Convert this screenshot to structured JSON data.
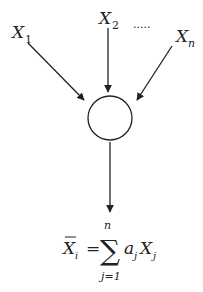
{
  "diagram": {
    "inputs": [
      {
        "symbol": "X",
        "subscript": "1"
      },
      {
        "symbol": "X",
        "subscript": "2"
      },
      {
        "symbol": "X",
        "subscript": "n"
      }
    ],
    "ellipsis": ".....",
    "node": "summation-neuron",
    "output_formula": {
      "lhs_symbol": "X",
      "lhs_subscript": "i",
      "equals": "=",
      "sum_symbol": "∑",
      "upper_limit": "n",
      "lower_limit": "j=1",
      "term_coef": "a",
      "term_coef_sub": "j",
      "term_var": "X",
      "term_var_sub": "j"
    }
  },
  "colors": {
    "line": "#222222",
    "background": "#ffffff"
  }
}
